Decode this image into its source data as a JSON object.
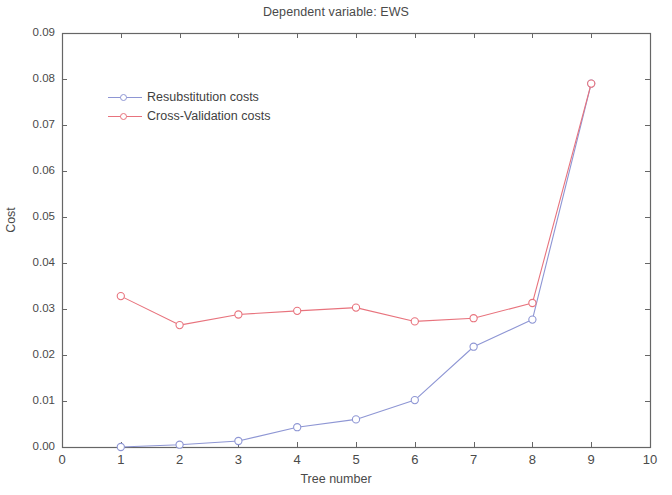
{
  "chart_data": {
    "type": "line",
    "title": "Dependent variable: EWS",
    "xlabel": "Tree number",
    "ylabel": "Cost",
    "x": [
      1,
      2,
      3,
      4,
      5,
      6,
      7,
      8,
      9
    ],
    "xlim": [
      0,
      10
    ],
    "ylim": [
      0.0,
      0.09
    ],
    "xticks": [
      "0",
      "1",
      "2",
      "3",
      "4",
      "5",
      "6",
      "7",
      "8",
      "9",
      "10"
    ],
    "xtick_values": [
      0,
      1,
      2,
      3,
      4,
      5,
      6,
      7,
      8,
      9,
      10
    ],
    "yticks": [
      "0.00",
      "0.01",
      "0.02",
      "0.03",
      "0.04",
      "0.05",
      "0.06",
      "0.07",
      "0.08",
      "0.09"
    ],
    "ytick_values": [
      0.0,
      0.01,
      0.02,
      0.03,
      0.04,
      0.05,
      0.06,
      0.07,
      0.08,
      0.09
    ],
    "grid": false,
    "legend_position": "upper-left-inside",
    "series": [
      {
        "name": "Resubstitution costs",
        "color": "#8e96d4",
        "marker": "open-circle",
        "x": [
          1,
          2,
          3,
          4,
          5,
          6,
          7,
          8,
          9
        ],
        "values": [
          0.0,
          0.0005,
          0.0013,
          0.0043,
          0.006,
          0.0102,
          0.0218,
          0.0277,
          0.079
        ]
      },
      {
        "name": "Cross-Validation costs",
        "color": "#e8737d",
        "marker": "open-circle",
        "x": [
          1,
          2,
          3,
          4,
          5,
          6,
          7,
          8,
          9
        ],
        "values": [
          0.0328,
          0.0265,
          0.0288,
          0.0296,
          0.0303,
          0.0273,
          0.028,
          0.0313,
          0.079
        ]
      }
    ]
  },
  "colors": {
    "axis": "#666666",
    "text": "#4a4a4a",
    "background": "#ffffff",
    "series_resubstitution": "#8e96d4",
    "series_crossvalidation": "#e8737d"
  }
}
